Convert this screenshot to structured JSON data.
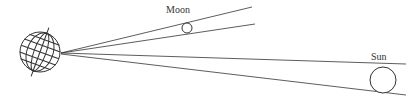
{
  "diagram": {
    "title": "",
    "labels": {
      "moon": "Moon",
      "sun": "Sun"
    },
    "objects": [
      {
        "name": "earth",
        "icon": "globe-icon",
        "cx": 40,
        "cy": 52,
        "r": 20
      },
      {
        "name": "moon",
        "cx": 187,
        "cy": 28,
        "r": 5
      },
      {
        "name": "sun",
        "cx": 383,
        "cy": 82,
        "r": 13
      }
    ],
    "colors": {
      "stroke": "#333333",
      "background": "#ffffff"
    }
  }
}
